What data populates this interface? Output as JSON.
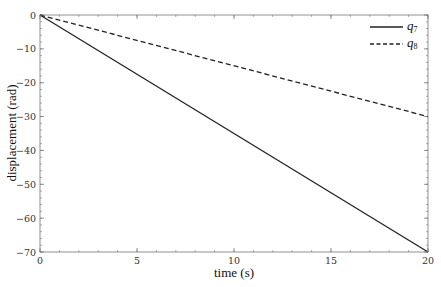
{
  "chart_data": {
    "type": "line",
    "title": "",
    "xlabel": "time (s)",
    "ylabel": "displacement (rad)",
    "xlim": [
      0,
      20
    ],
    "ylim": [
      -70,
      0
    ],
    "xticks": [
      0,
      5,
      10,
      15,
      20
    ],
    "yticks": [
      0,
      -10,
      -20,
      -30,
      -40,
      -50,
      -60,
      -70
    ],
    "x_minor_step": 1,
    "y_minor_step": 2,
    "grid": false,
    "legend_position": "upper right",
    "series": [
      {
        "name": "q7",
        "label_base": "q",
        "label_sub": "7",
        "style": "solid",
        "color": "#222222",
        "x": [
          0,
          20
        ],
        "y": [
          0,
          -70
        ]
      },
      {
        "name": "q8",
        "label_base": "q",
        "label_sub": "8",
        "style": "dashed",
        "color": "#222222",
        "x": [
          0,
          20
        ],
        "y": [
          0,
          -30
        ]
      }
    ]
  }
}
